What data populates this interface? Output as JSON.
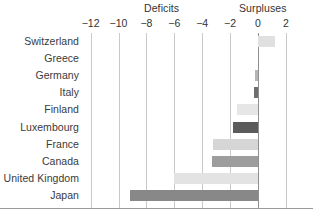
{
  "header": {
    "deficits_label": "Deficits",
    "surpluses_label": "Surpluses"
  },
  "chart_data": {
    "type": "bar",
    "orientation": "horizontal",
    "title": "",
    "subtitle": "",
    "xlabel": "",
    "ylabel": "",
    "xlim": [
      -13,
      2.6
    ],
    "grid": true,
    "legend": "none",
    "annotations": [
      "Deficits",
      "Surpluses"
    ],
    "xticks": [
      -12,
      -10,
      -8,
      -6,
      -4,
      -2,
      0,
      2
    ],
    "xtick_labels": [
      "−12",
      "−10",
      "−8",
      "−6",
      "−4",
      "−2",
      "0",
      "2"
    ],
    "categories": [
      "Switzerland",
      "Greece",
      "Germany",
      "Italy",
      "Finland",
      "Luxembourg",
      "France",
      "Canada",
      "United Kingdom",
      "Japan"
    ],
    "values": [
      1.2,
      0.0,
      -0.2,
      -0.3,
      -1.5,
      -1.8,
      -3.2,
      -3.3,
      -6.0,
      -9.2
    ],
    "bar_colors": [
      "#e0e0e0",
      "#e0e0e0",
      "#b5b5b5",
      "#6e6e6e",
      "#e6e6e6",
      "#5b5b5b",
      "#d6d6d6",
      "#9d9d9d",
      "#e3e3e3",
      "#888888"
    ]
  },
  "colors": {
    "gridline": "#c9c9c9",
    "zero_line": "#8f8f8f",
    "axis_rule": "#9a9a9a",
    "text": "#3a3a3a"
  }
}
